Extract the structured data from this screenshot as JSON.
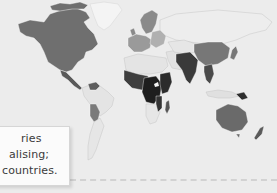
{
  "figure": {
    "type": "choropleth-world-map",
    "legend_scale": [
      "#e2e2e2",
      "#b8b8b8",
      "#8c8c8c",
      "#6a6a6a",
      "#444444",
      "#222222"
    ],
    "background": "#ececec",
    "regions": {
      "north_america": "#6f6f6f",
      "greenland": "#f4f4f4",
      "central_america": "#5a5a5a",
      "south_america_north": "#e4e4e4",
      "bolivia_paraguay": "#7a7a7a",
      "south_america_south": "#e6e6e6",
      "europe_north": "#8a8a8a",
      "europe_west": "#9a9a9a",
      "europe_east": "#b0b0b0",
      "russia": "#ededed",
      "north_africa": "#e4e4e4",
      "west_africa": "#3e3e3e",
      "central_africa": "#1e1e1e",
      "east_africa": "#2c2c2c",
      "southern_africa": "#e6e6e6",
      "madagascar": "#555555",
      "middle_east": "#e2e2e2",
      "central_asia": "#e6e6e6",
      "south_asia": "#3a3a3a",
      "china": "#777777",
      "southeast_asia": "#4a4a4a",
      "japan": "#777777",
      "indonesia": "#e0e0e0",
      "papua_new_guinea": "#2e2e2e",
      "australia": "#6a6a6a",
      "new_zealand": "#5a5a5a"
    }
  },
  "caption": {
    "line1": "ries",
    "line2": "alising;",
    "line3": "countries."
  }
}
